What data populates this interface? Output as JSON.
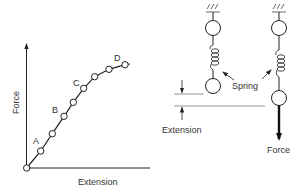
{
  "graph": {
    "x_axis_label": "Extension",
    "y_axis_label": "Force",
    "point_labels": [
      {
        "text": "A",
        "x": 33,
        "y": 144
      },
      {
        "text": "B",
        "x": 52,
        "y": 112
      },
      {
        "text": "C",
        "x": 73,
        "y": 85
      },
      {
        "text": "D",
        "x": 114,
        "y": 61
      }
    ],
    "points": [
      [
        26.7,
        168
      ],
      [
        40.7,
        151
      ],
      [
        52.3,
        133.7
      ],
      [
        64,
        116.3
      ],
      [
        73.3,
        102.3
      ],
      [
        83.7,
        88.3
      ],
      [
        94.7,
        76.7
      ],
      [
        109,
        69.3
      ],
      [
        125,
        64.7
      ]
    ]
  },
  "springs": {
    "spring_label": "Spring",
    "extension_label": "Extension",
    "force_label": "Force"
  },
  "colors": {
    "line": "#222222",
    "thin_line": "#777777",
    "text": "#333333"
  }
}
